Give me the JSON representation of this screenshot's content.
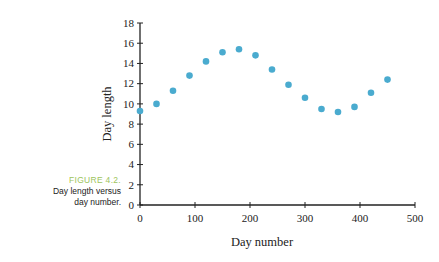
{
  "figure": {
    "number": "FIGURE 4.2.",
    "caption_line1": "Day length versus",
    "caption_line2": "day number.",
    "label_color": "#9dc45c"
  },
  "chart_data": {
    "type": "scatter",
    "title": "",
    "xlabel": "Day number",
    "ylabel": "Day length",
    "xlim": [
      0,
      500
    ],
    "ylim": [
      0,
      18
    ],
    "xticks": [
      0,
      100,
      200,
      300,
      400,
      500
    ],
    "yticks": [
      0,
      2,
      4,
      6,
      8,
      10,
      12,
      14,
      16,
      18
    ],
    "grid": false,
    "legend": null,
    "point_color": "#4aabcf",
    "x": [
      0,
      30,
      60,
      90,
      120,
      150,
      180,
      210,
      240,
      270,
      300,
      330,
      360,
      390,
      420,
      450
    ],
    "y": [
      9.3,
      10.0,
      11.3,
      12.8,
      14.2,
      15.1,
      15.4,
      14.8,
      13.4,
      11.9,
      10.6,
      9.5,
      9.2,
      9.7,
      11.1,
      12.4
    ]
  }
}
